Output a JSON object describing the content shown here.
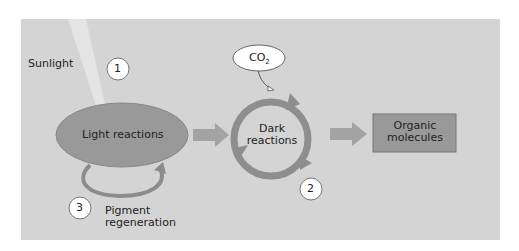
{
  "diagram": {
    "labels": {
      "sunlight": "Sunlight",
      "light_reactions": "Light reactions",
      "dark_reactions_line1": "Dark",
      "dark_reactions_line2": "reactions",
      "co2": "CO",
      "co2_subscript": "2",
      "organic_line1": "Organic",
      "organic_line2": "molecules",
      "pigment_line1": "Pigment",
      "pigment_line2": "regeneration"
    },
    "steps": [
      "1",
      "2",
      "3"
    ],
    "colors": {
      "panel": "#d4d4d4",
      "node_fill": "#999999",
      "arrow": "#9a9a9a",
      "bubble": "#ffffff"
    }
  }
}
